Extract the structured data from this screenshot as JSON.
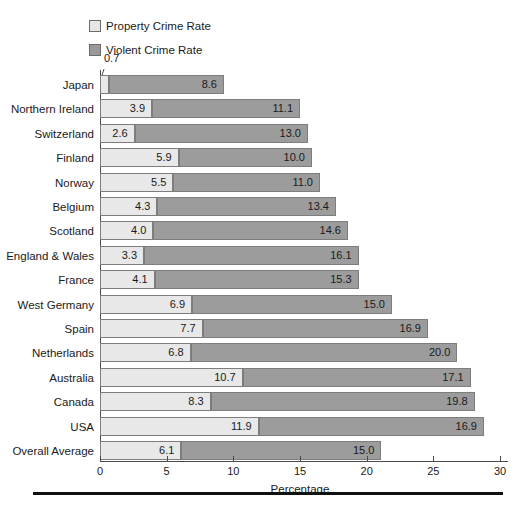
{
  "legend": {
    "items": [
      {
        "label": "Property Crime Rate",
        "key": "property",
        "color": "#e8e8e8"
      },
      {
        "label": "Violent Crime Rate",
        "key": "violent",
        "color": "#9c9c9c"
      }
    ]
  },
  "axis": {
    "x_title": "Percentage",
    "x_ticks": [
      "0",
      "5",
      "10",
      "15",
      "20",
      "25",
      "30"
    ]
  },
  "callout": {
    "value": "0.7"
  },
  "chart_data": {
    "type": "bar",
    "orientation": "horizontal",
    "stacked": true,
    "title": "",
    "xlabel": "Percentage",
    "ylabel": "",
    "xlim": [
      0,
      30
    ],
    "xticks": [
      0,
      5,
      10,
      15,
      20,
      25,
      30
    ],
    "grid": false,
    "legend_position": "top-left",
    "categories": [
      "Japan",
      "Northern Ireland",
      "Switzerland",
      "Finland",
      "Norway",
      "Belgium",
      "Scotland",
      "England & Wales",
      "France",
      "West Germany",
      "Spain",
      "Netherlands",
      "Australia",
      "Canada",
      "USA",
      "Overall Average"
    ],
    "series": [
      {
        "name": "Property Crime Rate",
        "color": "#e8e8e8",
        "values": [
          0.7,
          3.9,
          2.6,
          5.9,
          5.5,
          4.3,
          4.0,
          3.3,
          4.1,
          6.9,
          7.7,
          6.8,
          10.7,
          8.3,
          11.9,
          6.1
        ],
        "labels": [
          "0.7",
          "3.9",
          "2.6",
          "5.9",
          "5.5",
          "4.3",
          "4.0",
          "3.3",
          "4.1",
          "6.9",
          "7.7",
          "6.8",
          "10.7",
          "8.3",
          "11.9",
          "6.1"
        ]
      },
      {
        "name": "Violent Crime Rate",
        "color": "#9c9c9c",
        "values": [
          8.6,
          11.1,
          13.0,
          10.0,
          11.0,
          13.4,
          14.6,
          16.1,
          15.3,
          15.0,
          16.9,
          20.0,
          17.1,
          19.8,
          16.9,
          15.0
        ],
        "labels": [
          "8.6",
          "11.1",
          "13.0",
          "10.0",
          "11.0",
          "13.4",
          "14.6",
          "16.1",
          "15.3",
          "15.0",
          "16.9",
          "20.0",
          "17.1",
          "19.8",
          "16.9",
          "15.0"
        ]
      }
    ],
    "totals": [
      9.3,
      15.0,
      15.6,
      15.9,
      16.5,
      17.7,
      18.6,
      19.4,
      19.4,
      21.9,
      24.6,
      26.8,
      27.8,
      28.1,
      28.8,
      21.1
    ]
  }
}
